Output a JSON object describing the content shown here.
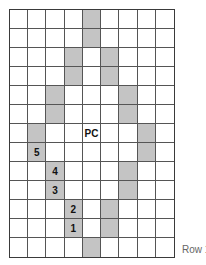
{
  "diagram": {
    "columns": 9,
    "rows": 13,
    "shade_color": "#c4c4c4",
    "shaded_cells": [
      [
        0,
        4
      ],
      [
        1,
        4
      ],
      [
        2,
        3
      ],
      [
        2,
        5
      ],
      [
        3,
        3
      ],
      [
        3,
        5
      ],
      [
        4,
        2
      ],
      [
        4,
        6
      ],
      [
        5,
        2
      ],
      [
        5,
        6
      ],
      [
        6,
        1
      ],
      [
        6,
        7
      ],
      [
        7,
        1
      ],
      [
        7,
        7
      ],
      [
        8,
        2
      ],
      [
        8,
        6
      ],
      [
        9,
        2
      ],
      [
        9,
        6
      ],
      [
        10,
        3
      ],
      [
        10,
        5
      ],
      [
        11,
        3
      ],
      [
        11,
        5
      ],
      [
        12,
        4
      ]
    ],
    "cell_labels": [
      {
        "row": 6,
        "col": 4,
        "text": "PC"
      },
      {
        "row": 7,
        "col": 1,
        "text": "5"
      },
      {
        "row": 8,
        "col": 2,
        "text": "4"
      },
      {
        "row": 9,
        "col": 2,
        "text": "3"
      },
      {
        "row": 10,
        "col": 3,
        "text": "2"
      },
      {
        "row": 11,
        "col": 3,
        "text": "1"
      }
    ],
    "row_label": "Row 1"
  }
}
